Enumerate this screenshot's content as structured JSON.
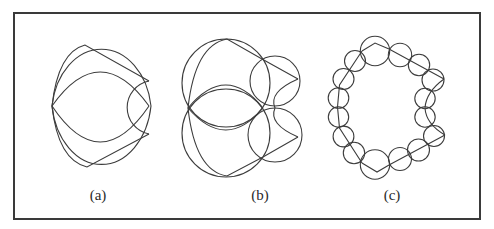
{
  "frame": {
    "x": 14,
    "y": 13,
    "width": 466,
    "height": 206,
    "stroke": "#3a3a3a"
  },
  "panels": [
    {
      "id": "a",
      "label": "(a)",
      "label_pos": [
        98,
        200
      ],
      "paths": [
        "M52,106 A50,66 0 0 1 151,106",
        "M52,106 A50,68 0 0 0 151,106",
        "M52,106 Q58,52 85,45 L149,81",
        "M52,106 Q58,160 87,167 L149,134",
        "M52,106 Q100,38 149,106",
        "M52,106 Q100,178 149,106",
        "M149,81 A27,27 0 0 0 149,134"
      ]
    },
    {
      "id": "b",
      "label": "(b)",
      "label_pos": [
        260,
        200
      ],
      "circles": [
        {
          "cx": 226,
          "cy": 83,
          "r": 44
        },
        {
          "cx": 226,
          "cy": 133,
          "r": 44
        },
        {
          "cx": 275,
          "cy": 81,
          "r": 25
        },
        {
          "cx": 275,
          "cy": 135,
          "r": 27
        }
      ],
      "paths": [
        "M188,108 Q195,45 227,39 L262,59 L298,79",
        "M188,108 Q195,171 227,176 L263,157 L298,137",
        "M188,108 Q226,62 263,108",
        "M188,108 Q226,152 263,108",
        "M298,79 Q268,92 275,108 Q268,124 298,137"
      ]
    },
    {
      "id": "c",
      "label": "(c)",
      "label_pos": [
        392,
        200
      ],
      "circles": [
        {
          "cx": 375,
          "cy": 51,
          "r": 14.7
        },
        {
          "cx": 355,
          "cy": 61,
          "r": 10.5
        },
        {
          "cx": 343.5,
          "cy": 79,
          "r": 10.5
        },
        {
          "cx": 338.5,
          "cy": 98,
          "r": 10.3
        },
        {
          "cx": 338.5,
          "cy": 117,
          "r": 10.2
        },
        {
          "cx": 343.5,
          "cy": 136.5,
          "r": 10.4
        },
        {
          "cx": 354,
          "cy": 153,
          "r": 10.7
        },
        {
          "cx": 375,
          "cy": 164.5,
          "r": 14.7
        },
        {
          "cx": 400,
          "cy": 159,
          "r": 11.5
        },
        {
          "cx": 418.5,
          "cy": 150,
          "r": 11
        },
        {
          "cx": 434,
          "cy": 136,
          "r": 10.5
        },
        {
          "cx": 425,
          "cy": 117,
          "r": 10.2
        },
        {
          "cx": 425,
          "cy": 98.5,
          "r": 10.2
        },
        {
          "cx": 433,
          "cy": 80,
          "r": 11
        },
        {
          "cx": 419,
          "cy": 65,
          "r": 10.7
        },
        {
          "cx": 400,
          "cy": 55,
          "r": 11.7
        }
      ],
      "paths": [
        "M362,51 L375,43 L389,49 L444,79",
        "M362,51 L339.5,85 L337.5,107 L339.5,128 L362,163",
        "M362,163 L377,172 L389,165 L445,135",
        "M444,79 Q426,92 425,108 Q426,124 445,135"
      ]
    }
  ]
}
